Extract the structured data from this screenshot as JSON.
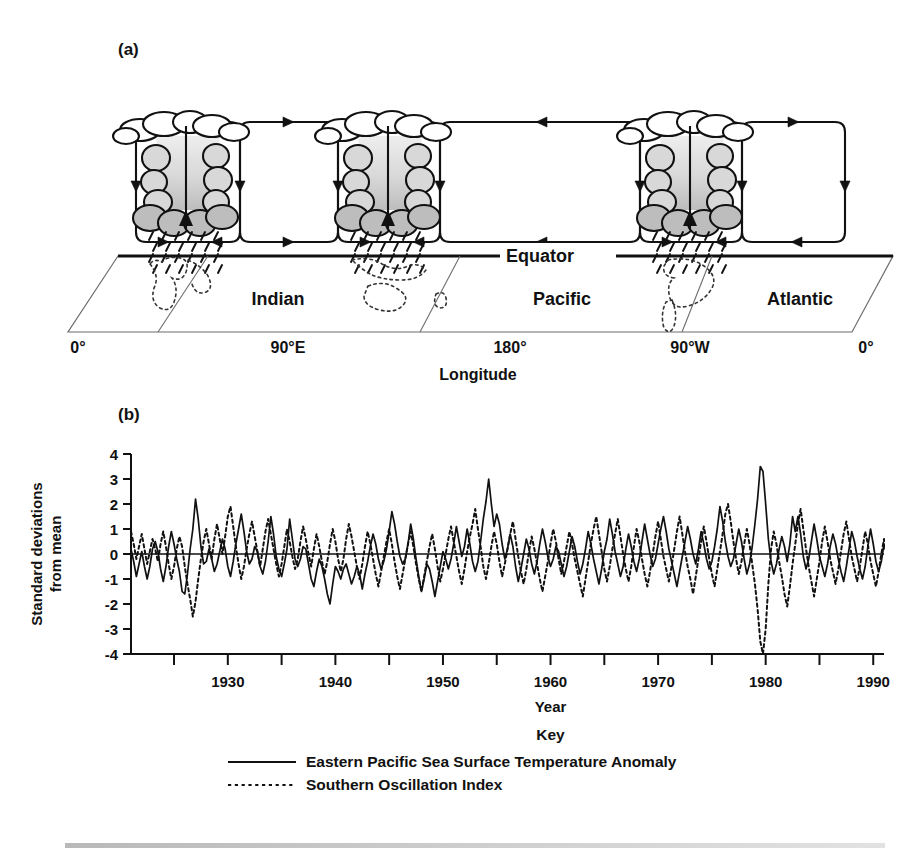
{
  "figure": {
    "panel_a_label": "(a)",
    "panel_b_label": "(b)"
  },
  "diagram": {
    "equator_label": "Equator",
    "longitude_axis_title": "Longitude",
    "longitude_ticks": [
      "0°",
      "90°E",
      "180°",
      "90°W",
      "0°"
    ],
    "ocean_labels": [
      "Indian",
      "Pacific",
      "Atlantic"
    ],
    "convection_cell_count": 3,
    "colors": {
      "line": "#111111",
      "cloud_fill_light": "#eeeeee",
      "cloud_fill_mid": "#d8d8d8",
      "cloud_fill_dark": "#bdbdbd",
      "coastline": "#333333"
    }
  },
  "key": {
    "title": "Key",
    "entries": [
      {
        "label": "Eastern Pacific Sea Surface Temperature Anomaly",
        "style": "solid"
      },
      {
        "label": "Southern Oscillation Index",
        "style": "dotted"
      }
    ]
  },
  "chart_data": {
    "type": "line",
    "title": "",
    "xlabel": "Year",
    "ylabel": "Standard deviations from mean",
    "ylabel_lines": [
      "Standard deviations",
      "from mean"
    ],
    "xlim": [
      1921,
      1991
    ],
    "ylim": [
      -4,
      4
    ],
    "yticks": [
      4,
      3,
      2,
      1,
      0,
      -1,
      -2,
      -3,
      -4
    ],
    "ytick_labels": [
      "4",
      "3",
      "2",
      "1",
      "0",
      "-1",
      "-2",
      "-3",
      "-4"
    ],
    "xticks_major": [
      1930,
      1940,
      1950,
      1960,
      1970,
      1980,
      1990
    ],
    "xtick_labels": [
      "1930",
      "1940",
      "1950",
      "1960",
      "1970",
      "1980",
      "1990"
    ],
    "xticks_minor": [
      1925,
      1935,
      1945,
      1955,
      1965,
      1975,
      1985
    ],
    "grid": false,
    "zero_line": true,
    "legend_position": "below",
    "x_step": 0.25,
    "series": [
      {
        "name": "Eastern Pacific Sea Surface Temperature Anomaly",
        "style": "solid",
        "x_start": 1921,
        "values": [
          0.2,
          -0.3,
          -0.9,
          -0.4,
          0.1,
          -0.5,
          -1.0,
          -0.5,
          0.2,
          0.5,
          0.1,
          -0.6,
          -1.1,
          -0.5,
          0.3,
          0.9,
          0.4,
          -0.2,
          -0.7,
          -1.5,
          -1.6,
          -0.8,
          0.2,
          1.0,
          2.2,
          1.4,
          0.3,
          -0.4,
          -0.3,
          0.2,
          -0.2,
          -0.7,
          -0.4,
          0.1,
          0.6,
          0.2,
          -0.5,
          -0.9,
          -0.3,
          0.4,
          1.0,
          1.6,
          0.9,
          0.1,
          -0.4,
          -0.2,
          0.3,
          0.1,
          -0.5,
          -0.8,
          -0.3,
          0.5,
          1.5,
          0.8,
          -0.1,
          -0.6,
          -0.9,
          -0.4,
          0.2,
          1.4,
          0.6,
          -0.2,
          -0.5,
          -0.2,
          0.3,
          0.2,
          -0.4,
          -1.0,
          -1.3,
          -0.7,
          -0.2,
          -0.5,
          -1.0,
          -1.6,
          -2.0,
          -1.2,
          -0.5,
          -0.7,
          -1.0,
          -0.6,
          -0.4,
          -0.8,
          -1.2,
          -0.9,
          -0.5,
          -0.8,
          -1.4,
          -0.8,
          -0.3,
          0.3,
          0.8,
          0.4,
          -0.2,
          -0.6,
          -0.3,
          0.2,
          0.9,
          1.7,
          1.2,
          0.5,
          -0.1,
          -0.4,
          -0.2,
          0.4,
          1.2,
          0.6,
          -0.2,
          -0.9,
          -1.5,
          -1.0,
          -0.4,
          -0.6,
          -1.1,
          -1.7,
          -1.1,
          -0.5,
          0.1,
          -0.2,
          -0.6,
          -0.2,
          0.4,
          1.1,
          0.5,
          -0.1,
          0.3,
          1.0,
          0.4,
          -0.3,
          -0.7,
          -0.3,
          0.5,
          1.4,
          2.1,
          3.0,
          2.0,
          1.1,
          1.6,
          1.2,
          0.4,
          -0.2,
          0.2,
          0.8,
          0.3,
          -0.5,
          -1.1,
          -0.6,
          0.0,
          0.6,
          0.2,
          -0.4,
          -0.8,
          -0.3,
          0.4,
          1.0,
          0.5,
          -0.1,
          -0.5,
          -0.2,
          0.3,
          0.1,
          -0.4,
          -0.9,
          -0.5,
          0.1,
          0.7,
          0.3,
          -0.3,
          -0.8,
          -0.4,
          0.2,
          0.9,
          0.4,
          -0.2,
          -0.7,
          -1.2,
          -0.6,
          0.1,
          0.6,
          1.4,
          0.8,
          0.1,
          -0.4,
          -0.9,
          -0.5,
          0.2,
          0.8,
          0.3,
          -0.3,
          -0.7,
          -0.2,
          0.5,
          1.2,
          0.6,
          0.0,
          -0.5,
          -0.2,
          0.4,
          1.0,
          1.5,
          0.9,
          0.2,
          -0.3,
          -0.8,
          -1.3,
          -0.7,
          -0.1,
          0.5,
          1.1,
          0.6,
          0.0,
          -0.4,
          0.2,
          0.9,
          0.4,
          -0.2,
          -0.6,
          -0.3,
          0.3,
          1.0,
          1.9,
          1.3,
          0.5,
          -0.1,
          -0.5,
          -0.2,
          0.4,
          1.0,
          0.5,
          -0.2,
          -0.8,
          -0.4,
          0.3,
          1.2,
          2.2,
          3.5,
          3.3,
          2.0,
          0.6,
          -0.3,
          -0.8,
          -0.4,
          0.2,
          0.7,
          0.3,
          -0.3,
          0.4,
          1.5,
          0.9,
          1.5,
          0.8,
          -0.1,
          -0.6,
          -0.2,
          0.5,
          1.2,
          0.6,
          -0.1,
          -0.5,
          -0.9,
          -0.4,
          0.3,
          0.8,
          0.4,
          -0.2,
          -0.7,
          -1.1,
          -0.5,
          0.2,
          0.9,
          0.5,
          -0.1,
          -0.6,
          -1.0,
          -0.5,
          0.3,
          1.0,
          0.4,
          -0.3,
          -0.7,
          -0.3,
          0.4,
          0.2
        ]
      },
      {
        "name": "Southern Oscillation Index",
        "style": "dotted",
        "x_start": 1921,
        "values": [
          0.9,
          0.4,
          -0.2,
          0.3,
          0.8,
          0.2,
          -0.4,
          0.1,
          0.6,
          0.2,
          -0.3,
          0.4,
          0.9,
          0.3,
          -0.4,
          -1.0,
          -0.5,
          0.2,
          0.7,
          0.3,
          -0.5,
          -1.2,
          -1.8,
          -2.5,
          -1.9,
          -1.0,
          -0.2,
          0.5,
          1.0,
          0.4,
          -0.2,
          0.6,
          1.2,
          0.6,
          0.0,
          0.7,
          1.5,
          1.9,
          1.1,
          0.3,
          -0.4,
          -1.0,
          -0.5,
          0.2,
          0.8,
          1.3,
          0.7,
          0.1,
          -0.5,
          0.2,
          0.9,
          1.4,
          0.8,
          0.2,
          -0.4,
          -0.9,
          -0.4,
          0.3,
          1.0,
          0.5,
          -0.1,
          -0.6,
          -0.2,
          0.5,
          1.1,
          0.6,
          0.0,
          -0.5,
          0.2,
          0.8,
          0.3,
          -0.3,
          -0.8,
          -0.3,
          0.4,
          1.0,
          0.5,
          -0.2,
          -0.7,
          -0.2,
          0.6,
          1.2,
          0.7,
          0.1,
          -0.5,
          -1.0,
          -0.4,
          0.3,
          0.9,
          0.4,
          -0.2,
          -0.8,
          -1.3,
          -0.7,
          -0.1,
          0.5,
          1.0,
          0.4,
          -0.3,
          -0.9,
          -1.4,
          -0.8,
          -0.2,
          0.4,
          0.9,
          0.3,
          -0.4,
          -1.0,
          -1.5,
          -0.9,
          -0.3,
          0.3,
          0.8,
          0.2,
          -0.5,
          -1.1,
          -0.6,
          0.0,
          0.6,
          1.1,
          0.5,
          -0.1,
          -0.7,
          -1.2,
          -0.6,
          0.1,
          0.7,
          1.2,
          1.8,
          1.0,
          0.3,
          -0.5,
          -1.0,
          -0.4,
          0.3,
          0.9,
          0.4,
          -0.3,
          -0.9,
          -0.4,
          0.2,
          0.8,
          1.3,
          0.6,
          -0.1,
          -0.7,
          -1.2,
          -0.6,
          0.1,
          0.7,
          0.2,
          -0.4,
          -1.0,
          -1.5,
          -0.9,
          -0.3,
          0.4,
          1.0,
          0.5,
          -0.2,
          -0.8,
          -0.3,
          0.3,
          0.9,
          0.4,
          -0.2,
          -0.7,
          -1.2,
          -1.7,
          -1.0,
          -0.3,
          0.4,
          1.0,
          1.5,
          0.8,
          0.1,
          -0.6,
          -1.1,
          -0.5,
          0.2,
          0.8,
          1.4,
          0.7,
          0.0,
          -0.6,
          -1.1,
          -0.5,
          0.3,
          1.0,
          0.5,
          -0.2,
          -0.8,
          -1.3,
          -0.7,
          0.0,
          0.7,
          1.3,
          0.6,
          -0.1,
          -0.6,
          -1.1,
          -0.5,
          0.2,
          0.9,
          1.5,
          0.8,
          0.1,
          -0.5,
          -1.0,
          -1.6,
          -0.9,
          -0.2,
          0.5,
          1.1,
          0.5,
          -0.2,
          -0.8,
          -1.3,
          -0.6,
          0.1,
          0.8,
          1.6,
          2.0,
          1.3,
          0.5,
          -0.2,
          -0.8,
          -0.3,
          0.4,
          1.0,
          0.4,
          -0.4,
          -1.2,
          -2.2,
          -3.5,
          -4.2,
          -3.0,
          -1.2,
          0.2,
          0.9,
          0.4,
          -0.3,
          -0.9,
          -1.6,
          -2.1,
          -1.3,
          -0.4,
          0.4,
          1.2,
          1.8,
          1.0,
          0.2,
          -0.5,
          -1.1,
          -1.7,
          -1.0,
          -0.3,
          0.5,
          1.1,
          0.5,
          -0.2,
          -0.7,
          -1.2,
          -0.6,
          0.1,
          0.8,
          1.3,
          0.6,
          -0.1,
          -0.6,
          -1.1,
          -0.5,
          0.2,
          0.9,
          0.4,
          -0.3,
          -0.8,
          -1.3,
          -0.7,
          0.0,
          0.6,
          0.3
        ]
      }
    ]
  }
}
